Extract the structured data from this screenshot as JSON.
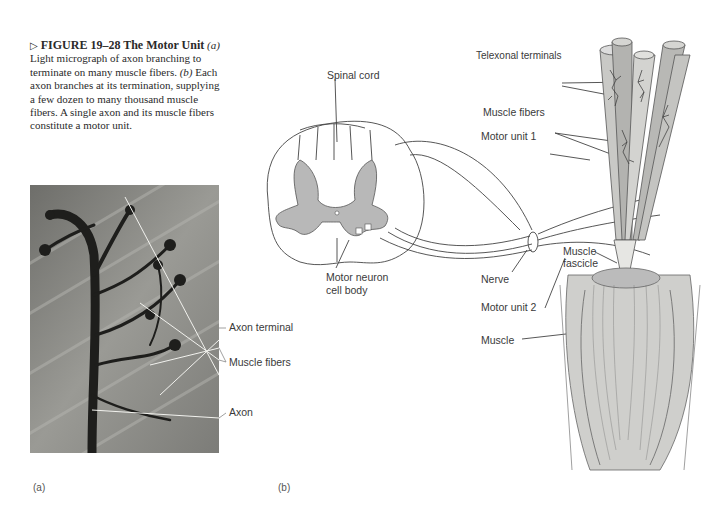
{
  "caption": {
    "arrow": "▷",
    "figure_label": "FIGURE 19–28",
    "title": "The Motor Unit",
    "line_a_marker": "(a)",
    "text_a": "Light micrograph of axon branching to terminate on many muscle fibers.",
    "line_b_marker": "(b)",
    "text_b": "Each axon branches at its termination, supplying a few dozen to many thousand muscle fibers. A single axon and its muscle fibers constitute a motor unit."
  },
  "panel_a": {
    "label": "(a)",
    "annotations": {
      "axon_terminal": "Axon terminal",
      "muscle_fibers": "Muscle fibers",
      "axon": "Axon"
    }
  },
  "panel_b": {
    "label": "(b)",
    "annotations": {
      "axonal_terminals": "Telexonal terminals",
      "spinal_cord": "Spinal cord",
      "muscle_fibers": "Muscle fibers",
      "motor_unit_1": "Motor unit 1",
      "muscle_fascicle_1": "Muscle",
      "muscle_fascicle_2": "fascicle",
      "motor_neuron_1": "Motor neuron",
      "motor_neuron_2": "cell body",
      "nerve": "Nerve",
      "motor_unit_2": "Motor unit 2",
      "muscle": "Muscle"
    }
  }
}
